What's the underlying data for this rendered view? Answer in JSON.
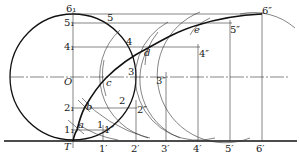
{
  "figure": {
    "circle": {
      "cx": 73,
      "cy": 77,
      "r": 63
    },
    "baseline_y": 141,
    "colors": {
      "ink": "#111111",
      "background": "#ffffff"
    }
  },
  "labels": {
    "center": "O",
    "tangent_point": "T",
    "circle_divisions": [
      "1₁",
      "2₁",
      "4₁",
      "5₁",
      "6₁"
    ],
    "circle_points": [
      "1",
      "2",
      "3",
      "4",
      "5"
    ],
    "curve_points": [
      "a",
      "b",
      "c",
      "d",
      "e"
    ],
    "baseline_points": [
      "1′",
      "2′",
      "3′",
      "4′",
      "5′",
      "6′"
    ],
    "double_primes": [
      "1″",
      "2″",
      "3″",
      "4″",
      "5″",
      "6″"
    ]
  },
  "points": {
    "div_y": {
      "6": 14,
      "5": 23,
      "4": 47,
      "O": 77,
      "2": 108,
      "1": 130
    },
    "baseline_x": [
      103,
      136,
      166,
      198,
      230,
      262
    ],
    "cycloid": [
      [
        73,
        141
      ],
      [
        77,
        130
      ],
      [
        85,
        107
      ],
      [
        106,
        78
      ],
      [
        148,
        48
      ],
      [
        198,
        25
      ],
      [
        262,
        14
      ]
    ]
  }
}
